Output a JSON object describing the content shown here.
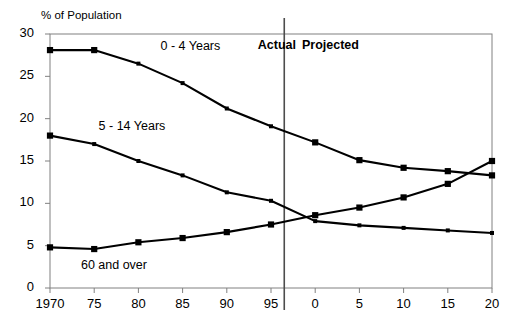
{
  "chart_data": {
    "type": "line",
    "title": "",
    "ylabel": "% of Population",
    "xlabel": "",
    "ylim": [
      0,
      30
    ],
    "yticks": [
      0,
      5,
      10,
      15,
      20,
      25,
      30
    ],
    "x": [
      1970,
      1975,
      1980,
      1985,
      1990,
      1995,
      2000,
      2005,
      2010,
      2015,
      2020
    ],
    "categories": [
      "1970",
      "75",
      "80",
      "85",
      "90",
      "95",
      "0",
      "5",
      "10",
      "15",
      "20"
    ],
    "grid": false,
    "legend": "inline-annotations",
    "series": [
      {
        "name": "0 - 4 Years",
        "values": [
          28.1,
          28.1,
          26.5,
          24.2,
          21.2,
          19.1,
          17.2,
          15.1,
          14.2,
          13.8,
          13.3
        ]
      },
      {
        "name": "5 - 14 Years",
        "values": [
          18.0,
          17.0,
          15.0,
          13.3,
          11.3,
          10.3,
          7.9,
          7.4,
          7.1,
          6.8,
          6.5
        ]
      },
      {
        "name": "60 and over",
        "values": [
          4.8,
          4.6,
          5.4,
          5.9,
          6.6,
          7.5,
          8.6,
          9.5,
          10.7,
          12.3,
          15.0
        ]
      }
    ],
    "annotations": [
      {
        "name": "actual-label",
        "text": "Actual",
        "x": 1993.5,
        "y": 28.6
      },
      {
        "name": "projected-label",
        "text": "Projected",
        "x": 1998.5,
        "y": 28.6
      },
      {
        "name": "divider",
        "text": "",
        "x": 1996.5
      }
    ],
    "series_label_positions": [
      {
        "text": "0 - 4 Years",
        "x": 1982.5,
        "y": 28.5
      },
      {
        "text": "5 - 14 Years",
        "x": 1975.5,
        "y": 19.0
      },
      {
        "text": "60 and over",
        "x": 1973.5,
        "y": 2.6
      }
    ],
    "colors": {
      "line": "#000000",
      "marker": "#000000",
      "axis": "#808080",
      "divider": "#4d4d4d",
      "background": "#ffffff"
    }
  }
}
